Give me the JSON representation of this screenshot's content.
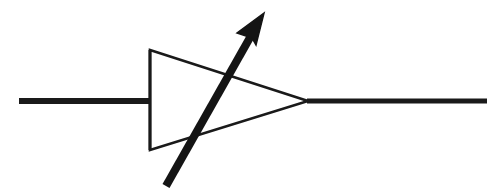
{
  "figure": {
    "width": 503,
    "height": 194,
    "background_color": "#ffffff",
    "stroke_color": "#1a1a1a",
    "symbol_type": "variable-diode"
  },
  "colors": {
    "background": "#ffffff",
    "ink": "#1a1a1a",
    "arrow": "#141414"
  },
  "parts": {
    "left_lead": {
      "label": "Anode lead wire",
      "x1": 19,
      "y1": 101,
      "x2": 150,
      "y2": 101,
      "thickness": 6
    },
    "right_lead": {
      "label": "Cathode lead wire",
      "x1": 307,
      "y1": 101,
      "x2": 487,
      "y2": 101,
      "thickness": 5
    },
    "cathode_bar": {
      "label": "Cathode bar",
      "x1": 150,
      "y1": 50,
      "x2": 150,
      "y2": 150,
      "thickness": 3
    },
    "triangle": {
      "label": "Anode triangle",
      "points": "150,50 308,101 150,150",
      "thickness": 2.6,
      "fill": "none"
    },
    "arrow": {
      "label": "Variability arrow",
      "shaft_x1": 166,
      "shaft_y1": 186,
      "shaft_x2": 252,
      "shaft_y2": 34,
      "tip_x": 264,
      "tip_y": 13,
      "head_points": "264,13 237,33 252,38 256,45",
      "shaft_thickness": 8
    }
  }
}
